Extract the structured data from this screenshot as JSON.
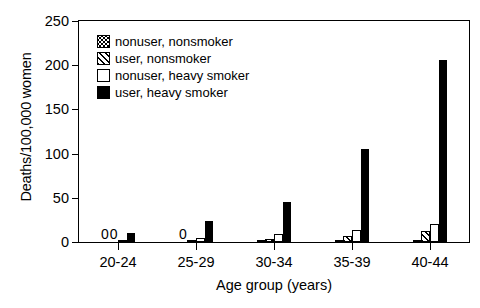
{
  "chart_data": {
    "type": "bar",
    "title": "",
    "xlabel": "Age group (years)",
    "ylabel": "Deaths/100,000 women",
    "categories": [
      "20-24",
      "25-29",
      "30-34",
      "35-39",
      "40-44"
    ],
    "ylim": [
      0,
      250
    ],
    "yticks": [
      0,
      50,
      100,
      150,
      200,
      250
    ],
    "grid": false,
    "legend_position": "upper left inside",
    "series": [
      {
        "name": "nonuser, nonsmoker",
        "fill": "checkered-dots",
        "values": [
          0,
          0,
          1.5,
          2,
          2.5
        ],
        "labels": [
          "0",
          "0",
          "",
          "",
          ""
        ]
      },
      {
        "name": "user, nonsmoker",
        "fill": "diagonal-hatch",
        "values": [
          0,
          1.5,
          3.5,
          7,
          12
        ],
        "labels": [
          "0",
          "",
          "",
          "",
          ""
        ]
      },
      {
        "name": "nonuser, heavy smoker",
        "fill": "open-white",
        "values": [
          2.5,
          4.5,
          9,
          14,
          20
        ],
        "labels": [
          "",
          "",
          "",
          "",
          ""
        ]
      },
      {
        "name": "user, heavy smoker",
        "fill": "solid-black",
        "values": [
          10,
          24,
          45,
          105,
          206
        ],
        "labels": [
          "",
          "",
          "",
          "",
          ""
        ]
      }
    ]
  },
  "legend": {
    "items": [
      {
        "label": "nonuser, nonsmoker"
      },
      {
        "label": "user, nonsmoker"
      },
      {
        "label": "nonuser, heavy smoker"
      },
      {
        "label": "user, heavy smoker"
      }
    ]
  }
}
